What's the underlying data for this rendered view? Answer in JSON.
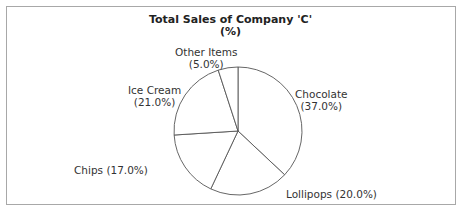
{
  "chart_data": {
    "type": "pie",
    "title": "Total Sales of Company 'C'",
    "subtitle": "(%)",
    "categories": [
      "Chocolate",
      "Lollipops",
      "Chips",
      "Ice Cream",
      "Other Items"
    ],
    "values": [
      37.0,
      20.0,
      17.0,
      21.0,
      5.0
    ],
    "labels": [
      "Chocolate\n(37.0%)",
      "Lollipops (20.0%)",
      "Chips (17.0%)",
      "Ice Cream\n(21.0%)",
      "Other Items\n(5.0%)"
    ],
    "start_angle": "12 o'clock",
    "direction": "clockwise",
    "legend": "none"
  },
  "labels": {
    "chocolate_name": "Chocolate",
    "chocolate_pct": "(37.0%)",
    "lollipops": "Lollipops (20.0%)",
    "chips": "Chips (17.0%)",
    "icecream_name": "Ice Cream",
    "icecream_pct": "(21.0%)",
    "other_name": "Other Items",
    "other_pct": "(5.0%)"
  }
}
